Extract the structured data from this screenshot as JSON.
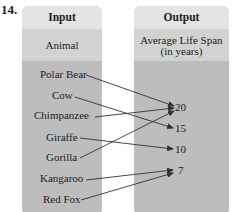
{
  "problem_number": "14.",
  "input": {
    "header": "Input",
    "label": "Animal",
    "items": [
      "Polar Bear",
      "Cow",
      "Chimpanzee",
      "Giraffe",
      "Gorilla",
      "Kangaroo",
      "Red Fox"
    ]
  },
  "output": {
    "header": "Output",
    "label_line1": "Average Life Span",
    "label_line2": "(in years)",
    "values": [
      "20",
      "15",
      "10",
      "7"
    ]
  },
  "mappings": [
    {
      "from": "Polar Bear",
      "to": "20"
    },
    {
      "from": "Cow",
      "to": "15"
    },
    {
      "from": "Chimpanzee",
      "to": "20"
    },
    {
      "from": "Giraffe",
      "to": "10"
    },
    {
      "from": "Gorilla",
      "to": "20"
    },
    {
      "from": "Kangaroo",
      "to": "7"
    },
    {
      "from": "Red Fox",
      "to": "7"
    }
  ],
  "colors": {
    "header_bg": "#e4e4e4",
    "label_bg": "#d2d2d2",
    "body_bg": "#bdbdbd",
    "arrow": "#333333"
  }
}
